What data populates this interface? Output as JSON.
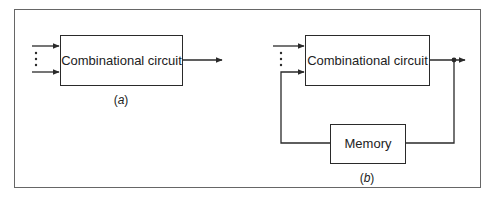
{
  "diagram": {
    "colors": {
      "stroke": "#2a2a2a",
      "frame": "#555555",
      "background": "#ffffff"
    },
    "panel_a": {
      "box_label": "Combinational circuit",
      "caption_open": "(",
      "caption_letter": "a",
      "caption_close": ")"
    },
    "panel_b": {
      "box_label": "Combinational circuit",
      "memory_label": "Memory",
      "caption_open": "(",
      "caption_letter": "b",
      "caption_close": ")"
    }
  }
}
